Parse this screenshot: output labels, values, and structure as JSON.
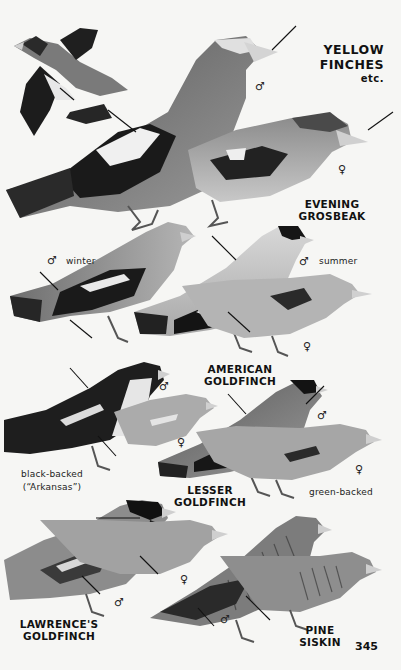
{
  "page": {
    "title_line1": "YELLOW",
    "title_line2": "FINCHES",
    "title_line3": "etc.",
    "page_number": "345"
  },
  "species": [
    {
      "name_line1": "EVENING",
      "name_line2": "GROSBEAK",
      "sexes": [
        "♂",
        "♀"
      ]
    },
    {
      "name_line1": "AMERICAN",
      "name_line2": "GOLDFINCH",
      "variant_labels": [
        "winter",
        "summer"
      ],
      "sexes": [
        "♂",
        "♂",
        "♀"
      ]
    },
    {
      "name_line1": "LESSER",
      "name_line2": "GOLDFINCH",
      "variant_labels": [
        "black-backed",
        "(“Arkansas”)",
        "green-backed"
      ],
      "sexes": [
        "♂",
        "♀",
        "♂",
        "♀"
      ]
    },
    {
      "name_line1": "LAWRENCE'S",
      "name_line2": "GOLDFINCH",
      "sexes": [
        "♂",
        "♀"
      ]
    },
    {
      "name_line1": "PINE",
      "name_line2": "SISKIN",
      "sexes": [
        "♂"
      ]
    }
  ],
  "colors": {
    "background": "#f6f6f4",
    "ink": "#111111"
  }
}
